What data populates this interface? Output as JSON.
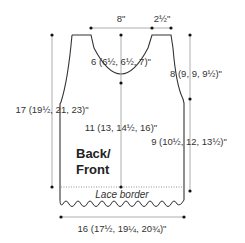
{
  "schematic": {
    "piece_label_line1": "Back/",
    "piece_label_line2": "Front",
    "border_label": "Lace border",
    "measurements": {
      "neck_width": "8\"",
      "shoulder_width": "2½\"",
      "neck_depth": "6 (6½, 6½, 7)\"",
      "armhole_depth": "8 (9, 9, 9½)\"",
      "total_length": "17 (19½, 21, 23)\"",
      "center_length_to_neck": "11 (13, 14½, 16)\"",
      "side_length_to_armhole": "9 (10½, 12, 13½)\"",
      "width": "16 (17½, 19¼, 20¾)\""
    },
    "colors": {
      "outline": "#333333",
      "measure_line": "#999999",
      "dot": "#111111",
      "text": "#333333"
    }
  }
}
